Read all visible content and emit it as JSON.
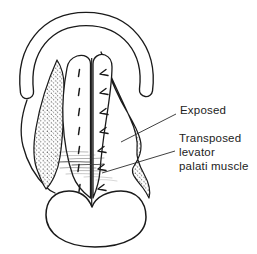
{
  "figure": {
    "kind": "medical line diagram",
    "parts": [
      "maxillary-arch",
      "left-palatal-flap",
      "right-palatal-flap",
      "exposed-area-left",
      "exposed-area-right",
      "midline-suture-line",
      "suture-marks",
      "muscle-sling-hatching",
      "tongue-outline"
    ],
    "suture_mark_pairs": 7
  },
  "colors": {
    "ink": "#1a1a1a",
    "background": "#ffffff",
    "label_text": "#222222",
    "hatch": "#3a3a3a"
  },
  "labels": {
    "exposed": {
      "text": "Exposed"
    },
    "transposed": {
      "text": "Transposed levator palati muscle",
      "line1": "Transposed",
      "line2": "levator",
      "line3": "palati muscle"
    }
  }
}
